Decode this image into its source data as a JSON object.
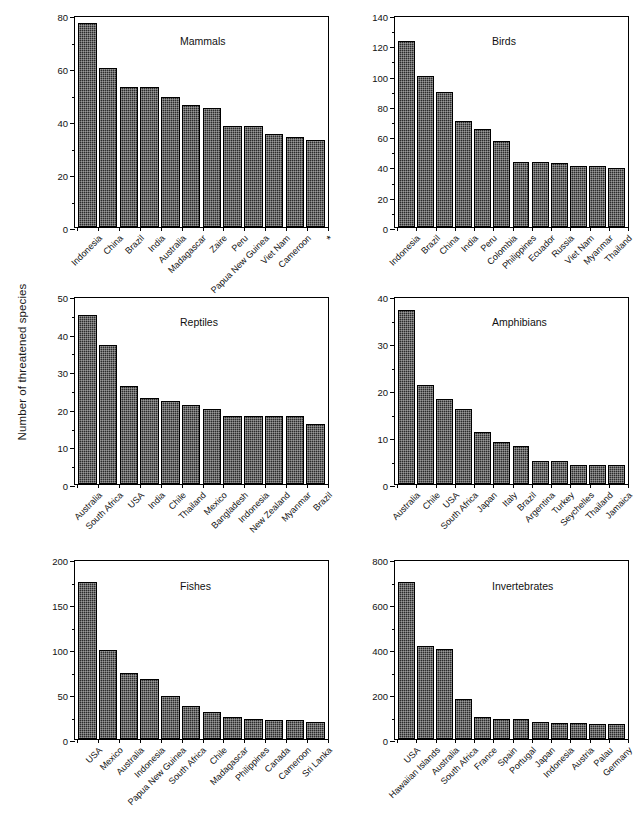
{
  "figure": {
    "ylabel": "Number of threatened species",
    "bar_color": "#2b2b2b",
    "axis_color": "#000000",
    "background": "#ffffff"
  },
  "chart_data": [
    {
      "type": "bar",
      "title": "Mammals",
      "xlabel": "",
      "ylabel": "Number of threatened species",
      "ylim": [
        0,
        80
      ],
      "yticks": [
        0,
        20,
        40,
        60,
        80
      ],
      "yminor_step": 10,
      "grid": false,
      "legend": "none",
      "categories": [
        "Indonesia",
        "China",
        "Brazil",
        "India",
        "Australia",
        "Madagascar",
        "Zaire",
        "Peru",
        "Papua New Guinea",
        "Viet Nam",
        "Cameroon",
        "*"
      ],
      "values": [
        77,
        60,
        53,
        53,
        49,
        46,
        45,
        38,
        38,
        35,
        34,
        33
      ]
    },
    {
      "type": "bar",
      "title": "Birds",
      "xlabel": "",
      "ylabel": "Number of threatened species",
      "ylim": [
        0,
        140
      ],
      "yticks": [
        0,
        20,
        40,
        60,
        80,
        100,
        120,
        140
      ],
      "yminor_step": 10,
      "grid": false,
      "legend": "none",
      "categories": [
        "Indonesia",
        "Brazil",
        "China",
        "India",
        "Peru",
        "Colombia",
        "Philippines",
        "Ecuador",
        "Russia",
        "Viet Nam",
        "Myanmar",
        "Thailand"
      ],
      "values": [
        123,
        100,
        89,
        70,
        65,
        57,
        43,
        43,
        42,
        40,
        40,
        39
      ]
    },
    {
      "type": "bar",
      "title": "Reptiles",
      "xlabel": "",
      "ylabel": "Number of threatened species",
      "ylim": [
        0,
        50
      ],
      "yticks": [
        0,
        10,
        20,
        30,
        40,
        50
      ],
      "yminor_step": 5,
      "grid": false,
      "legend": "none",
      "categories": [
        "Australia",
        "South Africa",
        "USA",
        "India",
        "Chile",
        "Thailand",
        "Mexico",
        "Bangladesh",
        "Indonesia",
        "New Zealand",
        "Myanmar",
        "Brazil"
      ],
      "values": [
        45,
        37,
        26,
        23,
        22,
        21,
        20,
        18,
        18,
        18,
        18,
        16
      ]
    },
    {
      "type": "bar",
      "title": "Amphibians",
      "xlabel": "",
      "ylabel": "Number of threatened species",
      "ylim": [
        0,
        40
      ],
      "yticks": [
        0,
        10,
        20,
        30,
        40
      ],
      "yminor_step": 5,
      "grid": false,
      "legend": "none",
      "categories": [
        "Australia",
        "Chile",
        "USA",
        "South Africa",
        "Japan",
        "Italy",
        "Brazil",
        "Argentina",
        "Turkey",
        "Seychelles",
        "Thailand",
        "Jamaica"
      ],
      "values": [
        37,
        21,
        18,
        16,
        11,
        9,
        8,
        5,
        5,
        4,
        4,
        4
      ]
    },
    {
      "type": "bar",
      "title": "Fishes",
      "xlabel": "",
      "ylabel": "Number of threatened species",
      "ylim": [
        0,
        200
      ],
      "yticks": [
        0,
        50,
        100,
        150,
        200
      ],
      "yminor_step": 25,
      "grid": false,
      "legend": "none",
      "categories": [
        "USA",
        "Mexico",
        "Australia",
        "Indonesia",
        "Papua New Guinea",
        "South Africa",
        "Chile",
        "Madagascar",
        "Philippines",
        "Canada",
        "Cameroon",
        "Sri Lanka"
      ],
      "values": [
        175,
        99,
        73,
        67,
        48,
        37,
        30,
        24,
        22,
        21,
        21,
        19
      ]
    },
    {
      "type": "bar",
      "title": "Invertebrates",
      "xlabel": "",
      "ylabel": "Number of threatened species",
      "ylim": [
        0,
        800
      ],
      "yticks": [
        0,
        200,
        400,
        600,
        800
      ],
      "yminor_step": 100,
      "grid": false,
      "legend": "none",
      "categories": [
        "USA",
        "Hawaiian Islands",
        "Australia",
        "South Africa",
        "France",
        "Spain",
        "Portugal",
        "Japan",
        "Indonesia",
        "Austria",
        "Palau",
        "Germany"
      ],
      "values": [
        700,
        415,
        400,
        180,
        100,
        90,
        88,
        75,
        72,
        70,
        68,
        68
      ]
    }
  ]
}
